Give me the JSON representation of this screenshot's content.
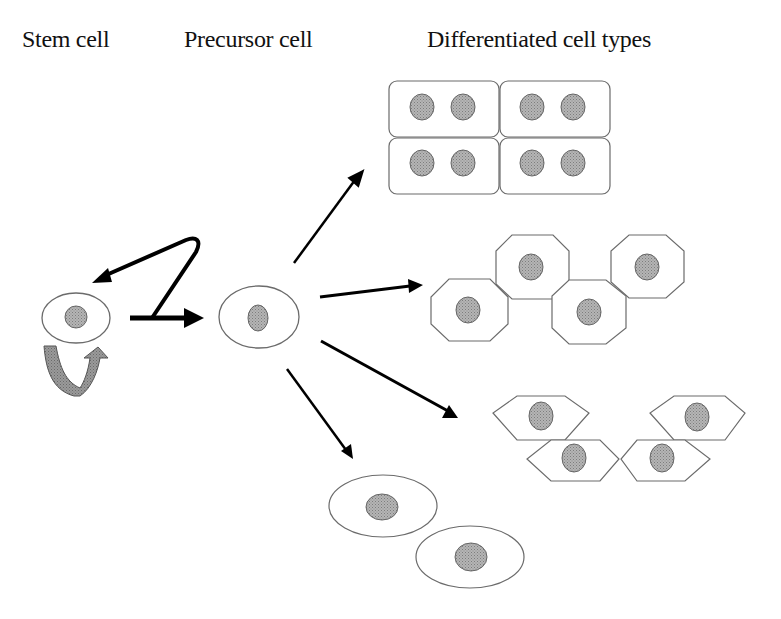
{
  "diagram": {
    "type": "stem cell differentiation schematic",
    "column_labels": {
      "stem_cell": "Stem cell",
      "precursor_cell": "Precursor cell",
      "differentiated": "Differentiated cell types"
    },
    "nodes": [
      {
        "id": "stem-cell",
        "label": "Stem cell",
        "shape": "ellipse",
        "self_renewal_arrow": true
      },
      {
        "id": "precursor-cell",
        "label": "Precursor cell",
        "shape": "ellipse"
      },
      {
        "id": "cuboidal-cells",
        "shape": "rounded-rectangles",
        "count": 4,
        "nuclei_per_cell": 2
      },
      {
        "id": "octagonal-cells",
        "shape": "octagons",
        "count": 4,
        "nuclei_per_cell": 1
      },
      {
        "id": "hexagonal-cells",
        "shape": "elongated-hexagons",
        "count": 4,
        "nuclei_per_cell": 1
      },
      {
        "id": "oval-cells",
        "shape": "ellipses",
        "count": 2,
        "nuclei_per_cell": 1
      }
    ],
    "edges": [
      {
        "from": "stem-cell",
        "to": "precursor-cell",
        "style": "bold",
        "note": "with return branch to stem cell"
      },
      {
        "from": "precursor-cell",
        "to": "cuboidal-cells"
      },
      {
        "from": "precursor-cell",
        "to": "octagonal-cells"
      },
      {
        "from": "precursor-cell",
        "to": "hexagonal-cells"
      },
      {
        "from": "precursor-cell",
        "to": "oval-cells"
      }
    ],
    "colors": {
      "outline": "#6b6b6b",
      "nucleus": "#a9a9a9",
      "nucleus_outline": "#555555",
      "arrow": "#000000",
      "self_renewal_arrow": "#8c8c8c"
    }
  }
}
